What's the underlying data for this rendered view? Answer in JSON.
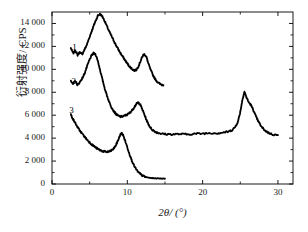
{
  "chart_data": {
    "type": "line",
    "title": "",
    "xlabel": "2θ/ (°)",
    "ylabel": "衍射强度/ CPS",
    "xlim": [
      0,
      32
    ],
    "ylim": [
      0,
      15000
    ],
    "xticks": [
      0,
      10,
      20,
      30
    ],
    "xticklabels": [
      "0",
      "10",
      "20",
      "30"
    ],
    "yticks": [
      0,
      2000,
      4000,
      6000,
      8000,
      10000,
      12000,
      14000
    ],
    "yticklabels": [
      "0",
      "2 000",
      "4 000",
      "6 000",
      "8 000",
      "10 000",
      "12 000",
      "14 000"
    ],
    "grid": false,
    "legend": "inline-curve-labels",
    "line_color": "#000000",
    "series": [
      {
        "name": "1",
        "label": "1",
        "label_x": 3.0,
        "label_y": 11700,
        "points": [
          [
            2.5,
            11850
          ],
          [
            2.8,
            11400
          ],
          [
            3.1,
            11650
          ],
          [
            3.4,
            11250
          ],
          [
            3.7,
            11500
          ],
          [
            4.0,
            11300
          ],
          [
            4.3,
            11700
          ],
          [
            4.6,
            12100
          ],
          [
            4.9,
            12650
          ],
          [
            5.2,
            13200
          ],
          [
            5.5,
            13750
          ],
          [
            5.8,
            14250
          ],
          [
            6.1,
            14700
          ],
          [
            6.4,
            14820
          ],
          [
            6.7,
            14600
          ],
          [
            7.0,
            14200
          ],
          [
            7.3,
            13750
          ],
          [
            7.6,
            13300
          ],
          [
            7.9,
            12900
          ],
          [
            8.2,
            12500
          ],
          [
            8.5,
            12100
          ],
          [
            8.8,
            11750
          ],
          [
            9.1,
            11400
          ],
          [
            9.4,
            11100
          ],
          [
            9.7,
            10800
          ],
          [
            10.0,
            10500
          ],
          [
            10.3,
            10250
          ],
          [
            10.6,
            10050
          ],
          [
            10.9,
            9900
          ],
          [
            11.2,
            9950
          ],
          [
            11.5,
            10300
          ],
          [
            11.8,
            10800
          ],
          [
            12.05,
            11200
          ],
          [
            12.3,
            11320
          ],
          [
            12.55,
            11050
          ],
          [
            12.8,
            10500
          ],
          [
            13.1,
            9950
          ],
          [
            13.4,
            9500
          ],
          [
            13.7,
            9150
          ],
          [
            14.0,
            8900
          ],
          [
            14.4,
            8700
          ],
          [
            14.8,
            8620
          ]
        ]
      },
      {
        "name": "2",
        "label": "2",
        "label_x": 2.9,
        "label_y": 8700,
        "points": [
          [
            2.5,
            9050
          ],
          [
            2.8,
            8700
          ],
          [
            3.1,
            9000
          ],
          [
            3.4,
            8600
          ],
          [
            3.7,
            8900
          ],
          [
            4.0,
            9200
          ],
          [
            4.3,
            9600
          ],
          [
            4.6,
            10150
          ],
          [
            4.9,
            10700
          ],
          [
            5.2,
            11150
          ],
          [
            5.5,
            11400
          ],
          [
            5.8,
            11300
          ],
          [
            6.1,
            10700
          ],
          [
            6.4,
            9900
          ],
          [
            6.7,
            9100
          ],
          [
            7.0,
            8350
          ],
          [
            7.3,
            7700
          ],
          [
            7.6,
            7150
          ],
          [
            7.9,
            6700
          ],
          [
            8.2,
            6350
          ],
          [
            8.5,
            6100
          ],
          [
            8.8,
            5950
          ],
          [
            9.1,
            5870
          ],
          [
            9.4,
            5900
          ],
          [
            9.7,
            5980
          ],
          [
            10.0,
            6050
          ],
          [
            10.3,
            6200
          ],
          [
            10.6,
            6400
          ],
          [
            10.9,
            6680
          ],
          [
            11.2,
            6980
          ],
          [
            11.45,
            7120
          ],
          [
            11.7,
            6950
          ],
          [
            12.0,
            6500
          ],
          [
            12.3,
            6000
          ],
          [
            12.6,
            5500
          ],
          [
            12.9,
            5100
          ],
          [
            13.2,
            4800
          ],
          [
            13.6,
            4600
          ],
          [
            14.0,
            4480
          ],
          [
            14.5,
            4400
          ],
          [
            15.0,
            4350
          ],
          [
            16.0,
            4330
          ],
          [
            17.0,
            4360
          ],
          [
            18.0,
            4330
          ],
          [
            19.0,
            4380
          ],
          [
            20.0,
            4400
          ],
          [
            21.0,
            4450
          ],
          [
            22.0,
            4430
          ],
          [
            22.8,
            4500
          ],
          [
            23.4,
            4560
          ],
          [
            23.9,
            4700
          ],
          [
            24.3,
            4950
          ],
          [
            24.7,
            5450
          ],
          [
            25.0,
            6300
          ],
          [
            25.3,
            7400
          ],
          [
            25.55,
            8050
          ],
          [
            25.8,
            7600
          ],
          [
            26.1,
            7150
          ],
          [
            26.4,
            6900
          ],
          [
            26.7,
            6500
          ],
          [
            27.0,
            6000
          ],
          [
            27.4,
            5450
          ],
          [
            27.8,
            5000
          ],
          [
            28.3,
            4650
          ],
          [
            28.8,
            4450
          ],
          [
            29.3,
            4320
          ],
          [
            30.0,
            4260
          ]
        ]
      },
      {
        "name": "3",
        "label": "3",
        "label_x": 2.6,
        "label_y": 6150,
        "points": [
          [
            2.5,
            6050
          ],
          [
            2.8,
            5650
          ],
          [
            3.1,
            5300
          ],
          [
            3.4,
            4950
          ],
          [
            3.7,
            4650
          ],
          [
            4.0,
            4400
          ],
          [
            4.3,
            4150
          ],
          [
            4.6,
            3900
          ],
          [
            4.9,
            3700
          ],
          [
            5.2,
            3500
          ],
          [
            5.5,
            3330
          ],
          [
            5.8,
            3180
          ],
          [
            6.1,
            3050
          ],
          [
            6.4,
            2950
          ],
          [
            6.7,
            2870
          ],
          [
            7.0,
            2820
          ],
          [
            7.3,
            2800
          ],
          [
            7.6,
            2830
          ],
          [
            7.9,
            2920
          ],
          [
            8.2,
            3100
          ],
          [
            8.5,
            3400
          ],
          [
            8.8,
            3850
          ],
          [
            9.05,
            4280
          ],
          [
            9.25,
            4430
          ],
          [
            9.45,
            4250
          ],
          [
            9.7,
            3800
          ],
          [
            10.0,
            3200
          ],
          [
            10.3,
            2600
          ],
          [
            10.6,
            2050
          ],
          [
            10.9,
            1600
          ],
          [
            11.2,
            1250
          ],
          [
            11.5,
            1000
          ],
          [
            11.8,
            830
          ],
          [
            12.1,
            700
          ],
          [
            12.5,
            600
          ],
          [
            13.0,
            530
          ],
          [
            13.5,
            500
          ],
          [
            14.0,
            490
          ],
          [
            14.5,
            480
          ],
          [
            15.0,
            470
          ]
        ]
      }
    ]
  }
}
